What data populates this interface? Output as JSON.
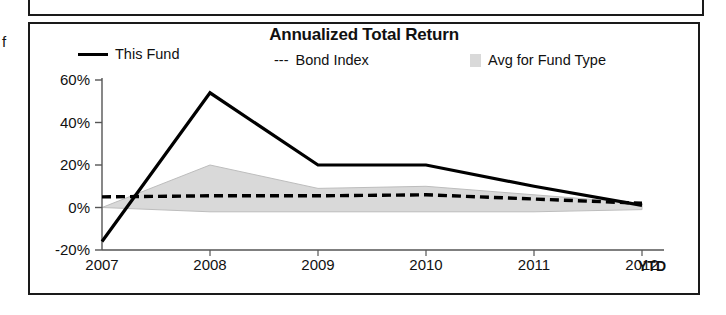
{
  "margin_glyph": "f",
  "chart": {
    "title": "Annualized Total Return",
    "legend": [
      {
        "label": "This Fund",
        "style": "solid-line",
        "color": "#000000"
      },
      {
        "label": "Bond Index",
        "style": "dashed-line",
        "prefix": "---",
        "color": "#000000"
      },
      {
        "label": "Avg for Fund Type",
        "style": "filled-band",
        "color": "#d9d9d9"
      }
    ],
    "x_axis_suffix": "YTD"
  },
  "chart_data": {
    "type": "line",
    "title": "Annualized Total Return",
    "xlabel": "",
    "ylabel": "",
    "categories": [
      "2007",
      "2008",
      "2009",
      "2010",
      "2011",
      "2012"
    ],
    "x_tick_labels": [
      "2007",
      "2008",
      "2009",
      "2010",
      "2011",
      "2012"
    ],
    "y_tick_labels": [
      "60%",
      "40%",
      "20%",
      "0%",
      "-20%"
    ],
    "y_ticks": [
      60,
      40,
      20,
      0,
      -20
    ],
    "ylim": [
      -20,
      60
    ],
    "yunit": "%",
    "grid": false,
    "legend_position": "top",
    "series": [
      {
        "name": "This Fund",
        "style": "solid",
        "color": "#000000",
        "values": [
          -16,
          54,
          20,
          20,
          10,
          1
        ]
      },
      {
        "name": "Bond Index",
        "style": "dashed",
        "color": "#000000",
        "values": [
          5,
          5.5,
          5.5,
          6,
          4,
          2
        ]
      },
      {
        "name": "Avg for Fund Type",
        "style": "band",
        "color": "#d9d9d9",
        "upper": [
          0,
          20,
          9,
          10,
          6,
          2
        ],
        "lower": [
          0,
          -2,
          -2,
          -2,
          -2,
          -1
        ]
      }
    ]
  }
}
